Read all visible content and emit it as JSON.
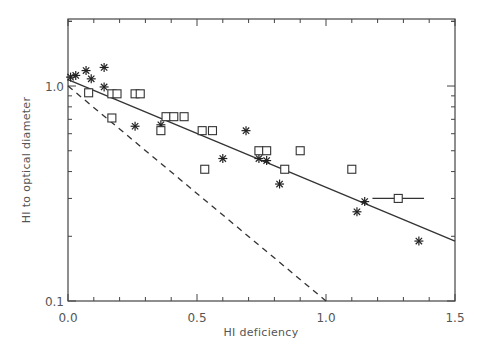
{
  "chart_data": {
    "type": "scatter",
    "title": "",
    "xlabel": "HI deficiency",
    "ylabel": "HI to optical diameter",
    "xlim": [
      0.0,
      1.5
    ],
    "ylim": [
      0.1,
      2.05
    ],
    "yscale": "log",
    "grid": false,
    "legend": null,
    "x_ticks": [
      "0.0",
      "0.5",
      "1.0",
      "1.5"
    ],
    "y_ticks": [
      "0.1",
      "1.0"
    ],
    "series": [
      {
        "name": "asterisk-points",
        "marker": "asterisk",
        "points": [
          {
            "x": 0.01,
            "y": 1.1
          },
          {
            "x": 0.03,
            "y": 1.12
          },
          {
            "x": 0.07,
            "y": 1.18
          },
          {
            "x": 0.09,
            "y": 1.08
          },
          {
            "x": 0.14,
            "y": 1.22
          },
          {
            "x": 0.14,
            "y": 0.99
          },
          {
            "x": 0.26,
            "y": 0.65
          },
          {
            "x": 0.36,
            "y": 0.66
          },
          {
            "x": 0.6,
            "y": 0.46
          },
          {
            "x": 0.69,
            "y": 0.62
          },
          {
            "x": 0.74,
            "y": 0.46
          },
          {
            "x": 0.77,
            "y": 0.45
          },
          {
            "x": 0.82,
            "y": 0.35
          },
          {
            "x": 1.12,
            "y": 0.26
          },
          {
            "x": 1.15,
            "y": 0.29
          },
          {
            "x": 1.36,
            "y": 0.19
          }
        ]
      },
      {
        "name": "square-points",
        "marker": "square",
        "points": [
          {
            "x": 0.08,
            "y": 0.93
          },
          {
            "x": 0.17,
            "y": 0.71
          },
          {
            "x": 0.17,
            "y": 0.92
          },
          {
            "x": 0.19,
            "y": 0.92
          },
          {
            "x": 0.26,
            "y": 0.92
          },
          {
            "x": 0.28,
            "y": 0.92
          },
          {
            "x": 0.36,
            "y": 0.62
          },
          {
            "x": 0.38,
            "y": 0.72
          },
          {
            "x": 0.41,
            "y": 0.72
          },
          {
            "x": 0.45,
            "y": 0.72
          },
          {
            "x": 0.52,
            "y": 0.62
          },
          {
            "x": 0.53,
            "y": 0.41
          },
          {
            "x": 0.56,
            "y": 0.62
          },
          {
            "x": 0.74,
            "y": 0.5
          },
          {
            "x": 0.77,
            "y": 0.5
          },
          {
            "x": 0.84,
            "y": 0.41
          },
          {
            "x": 0.9,
            "y": 0.5
          },
          {
            "x": 1.1,
            "y": 0.41
          },
          {
            "x": 1.28,
            "y": 0.3,
            "xerr": [
              1.18,
              1.38
            ]
          }
        ]
      }
    ],
    "lines": [
      {
        "name": "solid-fit",
        "style": "solid",
        "x": [
          0.0,
          1.5
        ],
        "y": [
          1.07,
          0.19
        ]
      },
      {
        "name": "dashed-relation",
        "style": "dashed",
        "x": [
          0.0,
          1.0
        ],
        "y": [
          1.0,
          0.1
        ]
      }
    ]
  }
}
